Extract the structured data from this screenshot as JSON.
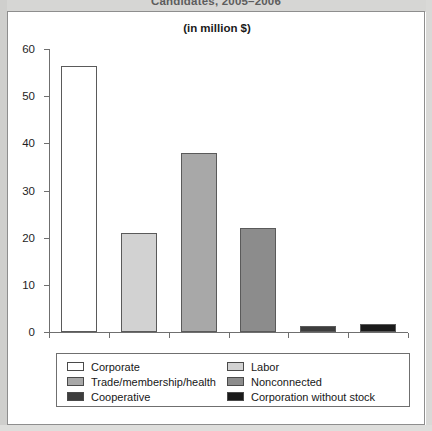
{
  "document": {
    "cropped_heading": "Candidates, 2005–2006"
  },
  "chart": {
    "subtitle": "(in million $)"
  },
  "chart_data": {
    "type": "bar",
    "title": "Candidates, 2005–2006",
    "subtitle": "(in million $)",
    "xlabel": "",
    "ylabel": "",
    "ylim": [
      0,
      60
    ],
    "yticks": [
      0,
      10,
      20,
      30,
      40,
      50,
      60
    ],
    "ytick_labels": [
      "0",
      "10",
      "20",
      "30",
      "40",
      "50",
      "60"
    ],
    "grid": false,
    "legend_position": "bottom",
    "categories": [
      "Corporate",
      "Labor",
      "Trade/membership/health",
      "Nonconnected",
      "Cooperative",
      "Corporation without stock"
    ],
    "values": [
      56.5,
      21.0,
      38.0,
      22.0,
      1.2,
      1.8
    ],
    "colors": [
      "#ffffff",
      "#d2d2d2",
      "#a8a8a8",
      "#8c8c8c",
      "#3d3d3d",
      "#1a1a1a"
    ]
  },
  "legend": {
    "items": [
      {
        "label": "Corporate",
        "color": "#ffffff"
      },
      {
        "label": "Labor",
        "color": "#d2d2d2"
      },
      {
        "label": "Trade/membership/health",
        "color": "#a8a8a8"
      },
      {
        "label": "Nonconnected",
        "color": "#8c8c8c"
      },
      {
        "label": "Cooperative",
        "color": "#3d3d3d"
      },
      {
        "label": "Corporation without stock",
        "color": "#1a1a1a"
      }
    ]
  }
}
